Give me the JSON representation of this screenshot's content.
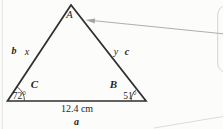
{
  "figure": {
    "type": "triangle-diagram",
    "vertex_labels": {
      "top": "A",
      "bottom_left": "C",
      "bottom_right": "B"
    },
    "angle_values": {
      "bottom_left": "72°",
      "bottom_right": "51°"
    },
    "side_labels": {
      "left_outer": "b",
      "left_inner": "x",
      "right_inner": "y",
      "right_outer": "c",
      "base_measure": "12.4 cm",
      "base_name": "a"
    },
    "annotations": {
      "callout_arrow_target": "vertex A"
    },
    "colors": {
      "triangle_stroke": "#2e2e2e",
      "angle_arc_stroke": "#4a4a4a",
      "text": "#1f1f1f",
      "arrow_gray": "#aeaeae",
      "callout_edge_gray": "#d3d3d3",
      "page_edge_gray": "#e4e4e4",
      "background": "#fcfcfb"
    }
  }
}
